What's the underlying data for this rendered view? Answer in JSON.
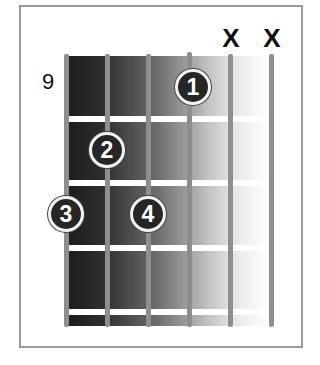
{
  "chord_diagram": {
    "starting_fret_label": "9",
    "string_count": 6,
    "fret_count": 4,
    "muted_strings": [
      {
        "string": 5,
        "label": "X"
      },
      {
        "string": 6,
        "label": "X"
      }
    ],
    "fingers": [
      {
        "label": "1",
        "string": 4,
        "fret": 1
      },
      {
        "label": "2",
        "string": 2,
        "fret": 2
      },
      {
        "label": "3",
        "string": 1,
        "fret": 3
      },
      {
        "label": "4",
        "string": 3,
        "fret": 3
      }
    ],
    "colors": {
      "finger_fill": "#262626",
      "finger_ring": "#f2f2f2",
      "string": "#8e8e8e",
      "fret": "#ffffff",
      "board_dark": "#1c1c1c",
      "board_light": "#ffffff",
      "frame": "#9a9a9a"
    }
  }
}
